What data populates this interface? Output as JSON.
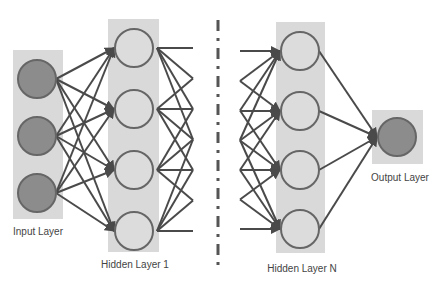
{
  "colors": {
    "background": "#ffffff",
    "layer_box": "#d9d9d9",
    "filled_node": "#8c8c8c",
    "hollow_node_fill": "#dcdcdc",
    "node_border": "#666666",
    "edge": "#4a4a4a",
    "separator": "#555555",
    "label": "#444444"
  },
  "layers": [
    {
      "id": "input",
      "label": "Input Layer",
      "box": {
        "x": 13,
        "y": 50,
        "w": 50,
        "h": 169
      },
      "node_style": "filled",
      "nodes": [
        {
          "x": 37,
          "y": 79
        },
        {
          "x": 37,
          "y": 136
        },
        {
          "x": 37,
          "y": 193
        }
      ],
      "label_pos": {
        "x": 38,
        "y": 226
      }
    },
    {
      "id": "hidden1",
      "label": "Hidden Layer 1",
      "box": {
        "x": 108,
        "y": 19,
        "w": 51,
        "h": 233
      },
      "node_style": "hollow",
      "nodes": [
        {
          "x": 134,
          "y": 48
        },
        {
          "x": 134,
          "y": 109
        },
        {
          "x": 134,
          "y": 170
        },
        {
          "x": 134,
          "y": 231
        }
      ],
      "label_pos": {
        "x": 135,
        "y": 259
      }
    },
    {
      "id": "hiddenN",
      "label": "Hidden Layer N",
      "box": {
        "x": 276,
        "y": 22,
        "w": 49,
        "h": 231
      },
      "node_style": "hollow",
      "nodes": [
        {
          "x": 300,
          "y": 51
        },
        {
          "x": 300,
          "y": 111
        },
        {
          "x": 300,
          "y": 170
        },
        {
          "x": 300,
          "y": 229
        }
      ],
      "label_pos": {
        "x": 302,
        "y": 263
      }
    },
    {
      "id": "output",
      "label": "Output Layer",
      "box": {
        "x": 372,
        "y": 110,
        "w": 51,
        "h": 54
      },
      "node_style": "filled",
      "nodes": [
        {
          "x": 397,
          "y": 137
        }
      ],
      "label_pos": {
        "x": 400,
        "y": 172
      }
    }
  ],
  "node_radius": 19,
  "separator": {
    "x": 218,
    "y1": 20,
    "y2": 266,
    "pattern": "dash-dot"
  },
  "truncated_out": {
    "from_layer": "hidden1",
    "end_x": 193
  },
  "truncated_in": {
    "to_layer": "hiddenN",
    "start_x": 240
  }
}
